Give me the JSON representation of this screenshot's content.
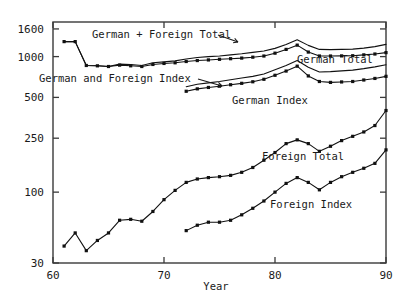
{
  "chart_data": {
    "type": "line",
    "title": "",
    "xlabel": "Year",
    "ylabel": "",
    "yscale": "log",
    "xlim": [
      60,
      90
    ],
    "ylim": [
      30,
      1800
    ],
    "grid": false,
    "legend_position": "inline-annotations",
    "xticks": [
      60,
      70,
      80,
      90
    ],
    "xticklabels": [
      "60",
      "70",
      "80",
      "90"
    ],
    "yticks": [
      30,
      100,
      250,
      500,
      1000,
      1600
    ],
    "yticklabels": [
      "30",
      "100",
      "250",
      "500",
      "1000",
      "1600"
    ],
    "series": [
      {
        "name": "German + Foreign Total",
        "markers": false,
        "x": [
          61,
          62,
          63,
          64,
          65,
          66,
          67,
          68,
          69,
          70,
          71,
          72,
          73,
          74,
          75,
          76,
          77,
          78,
          79,
          80,
          81,
          82,
          83,
          84,
          85,
          86,
          87,
          88,
          89,
          90
        ],
        "y": [
          1290,
          1290,
          860,
          855,
          845,
          880,
          875,
          860,
          900,
          915,
          930,
          960,
          985,
          1000,
          1010,
          1030,
          1050,
          1075,
          1100,
          1150,
          1230,
          1330,
          1210,
          1130,
          1125,
          1130,
          1135,
          1155,
          1185,
          1230
        ]
      },
      {
        "name": "German Total",
        "markers": true,
        "x": [
          61,
          62,
          63,
          64,
          65,
          66,
          67,
          68,
          69,
          70,
          71,
          72,
          73,
          74,
          75,
          76,
          77,
          78,
          79,
          80,
          81,
          82,
          83,
          84,
          85,
          86,
          87,
          88,
          89,
          90
        ],
        "y": [
          1290,
          1290,
          860,
          855,
          845,
          865,
          855,
          845,
          875,
          890,
          900,
          920,
          935,
          945,
          955,
          965,
          975,
          990,
          1010,
          1060,
          1130,
          1215,
          1080,
          1010,
          1010,
          1012,
          1015,
          1030,
          1045,
          1070
        ]
      },
      {
        "name": "German and Foreign Index",
        "markers": false,
        "x": [
          72,
          73,
          74,
          75,
          76,
          77,
          78,
          79,
          80,
          81,
          82,
          83,
          84,
          85,
          86,
          87,
          88,
          89,
          90
        ],
        "y": [
          600,
          625,
          640,
          655,
          675,
          695,
          715,
          745,
          800,
          860,
          935,
          835,
          770,
          775,
          785,
          795,
          815,
          840,
          870
        ]
      },
      {
        "name": "German Index",
        "markers": true,
        "x": [
          72,
          73,
          74,
          75,
          76,
          77,
          78,
          79,
          80,
          81,
          82,
          83,
          84,
          85,
          86,
          87,
          88,
          89,
          90
        ],
        "y": [
          555,
          578,
          592,
          605,
          620,
          635,
          652,
          680,
          728,
          782,
          850,
          720,
          655,
          645,
          650,
          655,
          672,
          690,
          715
        ]
      },
      {
        "name": "Foreign Total",
        "markers": true,
        "x": [
          61,
          62,
          63,
          64,
          65,
          66,
          67,
          68,
          69,
          70,
          71,
          72,
          73,
          74,
          75,
          76,
          77,
          78,
          79,
          80,
          81,
          82,
          83,
          84,
          85,
          86,
          87,
          88,
          89,
          90
        ],
        "y": [
          40,
          50,
          37,
          44,
          50,
          62,
          63,
          61,
          72,
          88,
          103,
          118,
          125,
          128,
          130,
          133,
          140,
          152,
          172,
          196,
          228,
          243,
          228,
          200,
          218,
          240,
          258,
          278,
          310,
          400
        ]
      },
      {
        "name": "Foreign Index",
        "markers": true,
        "x": [
          72,
          73,
          74,
          75,
          76,
          77,
          78,
          79,
          80,
          81,
          82,
          83,
          84,
          85,
          86,
          87,
          88,
          89,
          90
        ],
        "y": [
          52,
          57,
          60,
          60,
          62,
          68,
          76,
          86,
          100,
          116,
          128,
          118,
          104,
          118,
          130,
          140,
          150,
          163,
          205
        ]
      }
    ],
    "annotations": [
      {
        "name": "german-plus-foreign-total-label",
        "text": "German + Foreign Total",
        "x_px": 92,
        "y_px": 38,
        "arrow": true,
        "arrow_from": [
          218,
          35
        ],
        "arrow_to": [
          238,
          42
        ]
      },
      {
        "name": "german-and-foreign-index-label",
        "text": "German and Foreign Index",
        "x_px": 39,
        "y_px": 82,
        "arrow": true,
        "arrow_from": [
          198,
          79
        ],
        "arrow_to": [
          222,
          86
        ]
      },
      {
        "name": "german-total-label",
        "text": "German Total",
        "x_px": 297,
        "y_px": 63,
        "arrow": false
      },
      {
        "name": "german-index-label",
        "text": "German Index",
        "x_px": 232,
        "y_px": 104,
        "arrow": false
      },
      {
        "name": "foreign-total-label",
        "text": "Foreign Total",
        "x_px": 262,
        "y_px": 160,
        "arrow": false
      },
      {
        "name": "foreign-index-label",
        "text": "Foreign Index",
        "x_px": 270,
        "y_px": 208,
        "arrow": false
      }
    ]
  }
}
